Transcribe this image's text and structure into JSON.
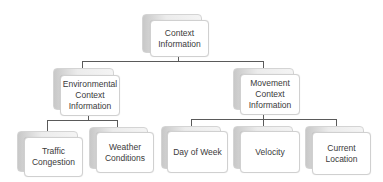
{
  "diagram": {
    "type": "hierarchy",
    "root": {
      "label": "Context\nInformation",
      "children": [
        {
          "label": "Environmental\nContext\nInformation",
          "children": [
            {
              "label": "Traffic\nCongestion"
            },
            {
              "label": "Weather\nConditions"
            }
          ]
        },
        {
          "label": "Movement\nContext\nInformation",
          "children": [
            {
              "label": "Day of Week"
            },
            {
              "label": "Velocity"
            },
            {
              "label": "Current\nLocation"
            }
          ]
        }
      ]
    }
  },
  "nodes": {
    "root": "Context\nInformation",
    "environmental": "Environmental\nContext\nInformation",
    "movement": "Movement\nContext\nInformation",
    "traffic": "Traffic\nCongestion",
    "weather": "Weather\nConditions",
    "day_of_week": "Day of Week",
    "velocity": "Velocity",
    "current_location": "Current\nLocation"
  },
  "colors": {
    "connector": "#5a5a5a",
    "box_border": "#d0d0d0",
    "text": "#3a3a3a"
  }
}
